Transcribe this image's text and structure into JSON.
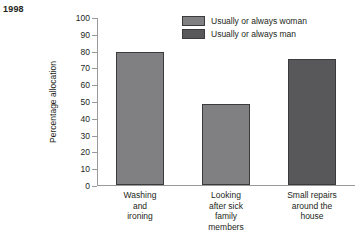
{
  "year_label": "1998",
  "legend": {
    "items": [
      {
        "label": "Usually or always woman",
        "color": "#808082"
      },
      {
        "label": "Usually or always man",
        "color": "#58585a"
      }
    ]
  },
  "chart_data": {
    "type": "bar",
    "title": "1998",
    "xlabel": "",
    "ylabel": "Percentage allocation",
    "ylim": [
      0,
      100
    ],
    "ytick_labels": [
      "100",
      "90",
      "80",
      "70",
      "60",
      "50",
      "40",
      "30",
      "20",
      "10",
      "0"
    ],
    "ytick_values": [
      100,
      90,
      80,
      70,
      60,
      50,
      40,
      30,
      20,
      10,
      0
    ],
    "grid": false,
    "legend_position": "top-right",
    "categories": [
      "Washing and ironing",
      "Looking after sick family members",
      "Small repairs around the house"
    ],
    "category_lines": [
      [
        "Washing",
        "and",
        "ironing"
      ],
      [
        "Looking",
        "after sick",
        "family",
        "members"
      ],
      [
        "Small repairs",
        "around the",
        "house"
      ]
    ],
    "values": [
      79,
      48,
      75
    ],
    "series_of_bar": [
      "Usually or always woman",
      "Usually or always woman",
      "Usually or always man"
    ],
    "bar_colors": [
      "#808082",
      "#808082",
      "#58585a"
    ]
  }
}
